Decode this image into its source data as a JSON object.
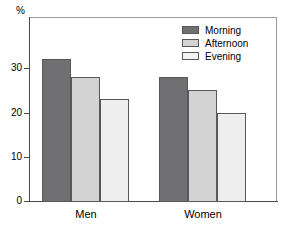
{
  "chart_data": {
    "type": "bar",
    "title": "",
    "subtitle": "",
    "xlabel": "",
    "ylabel": "%",
    "unit_label": "%",
    "categories": [
      "Men",
      "Women"
    ],
    "series": [
      {
        "name": "Morning",
        "values": [
          32,
          28
        ],
        "color": "#707073"
      },
      {
        "name": "Afternoon",
        "values": [
          28,
          25
        ],
        "color": "#d3d3d3"
      },
      {
        "name": "Evening",
        "values": [
          23,
          20
        ],
        "color": "#eeeeee"
      }
    ],
    "ylim": [
      0,
      35
    ],
    "yticks": [
      0,
      10,
      20,
      30
    ],
    "ytick_labels": [
      "0",
      "10",
      "20",
      "30"
    ],
    "grid": false,
    "legend_position": "top-right",
    "legend_entries": [
      "Morning",
      "Afternoon",
      "Evening"
    ],
    "annotations": []
  },
  "legend": {
    "items": [
      {
        "label": "Morning"
      },
      {
        "label": "Afternoon"
      },
      {
        "label": "Evening"
      }
    ]
  },
  "axes": {
    "y": {
      "unit": "%",
      "ticks": [
        "30",
        "20",
        "10",
        "0"
      ]
    },
    "x": {
      "groups": [
        "Men",
        "Women"
      ]
    }
  }
}
